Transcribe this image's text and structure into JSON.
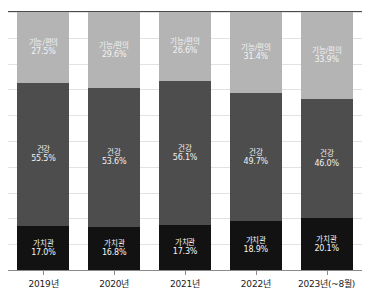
{
  "chart_data": {
    "type": "bar",
    "subtype": "stacked-100-percent",
    "title": "",
    "xlabel": "",
    "ylabel": "",
    "ylim": [
      0,
      100
    ],
    "grid": true,
    "legend_position": "none",
    "value_suffix": "%",
    "categories": [
      "2019년",
      "2020년",
      "2021년",
      "2022년",
      "2023년(~8월)"
    ],
    "series": [
      {
        "name": "가치관",
        "values": [
          17.0,
          16.8,
          17.3,
          18.9,
          20.1
        ],
        "color": "#121212"
      },
      {
        "name": "건강",
        "values": [
          55.5,
          53.6,
          56.1,
          49.7,
          46.0
        ],
        "color": "#4d4d4d"
      },
      {
        "name": "기능/편의",
        "values": [
          27.5,
          29.6,
          26.6,
          31.4,
          33.9
        ],
        "color": "#b4b4b4"
      }
    ],
    "bars": [
      {
        "category": "2019년",
        "segments": [
          {
            "name": "기능/편의",
            "value": "27.5%",
            "pct": 27.5
          },
          {
            "name": "건강",
            "value": "55.5%",
            "pct": 55.5
          },
          {
            "name": "가치관",
            "value": "17.0%",
            "pct": 17.0
          }
        ]
      },
      {
        "category": "2020년",
        "segments": [
          {
            "name": "기능/편의",
            "value": "29.6%",
            "pct": 29.6
          },
          {
            "name": "건강",
            "value": "53.6%",
            "pct": 53.6
          },
          {
            "name": "가치관",
            "value": "16.8%",
            "pct": 16.8
          }
        ]
      },
      {
        "category": "2021년",
        "segments": [
          {
            "name": "기능/편의",
            "value": "26.6%",
            "pct": 26.6
          },
          {
            "name": "건강",
            "value": "56.1%",
            "pct": 56.1
          },
          {
            "name": "가치관",
            "value": "17.3%",
            "pct": 17.3
          }
        ]
      },
      {
        "category": "2022년",
        "segments": [
          {
            "name": "기능/편의",
            "value": "31.4%",
            "pct": 31.4
          },
          {
            "name": "건강",
            "value": "49.7%",
            "pct": 49.7
          },
          {
            "name": "가치관",
            "value": "18.9%",
            "pct": 18.9
          }
        ]
      },
      {
        "category": "2023년(~8월)",
        "segments": [
          {
            "name": "기능/편의",
            "value": "33.9%",
            "pct": 33.9
          },
          {
            "name": "건강",
            "value": "46.0%",
            "pct": 46.0
          },
          {
            "name": "가치관",
            "value": "20.1%",
            "pct": 20.1
          }
        ]
      }
    ],
    "colors": {
      "segment_top": "#b4b4b4",
      "segment_middle": "#4d4d4d",
      "segment_bottom": "#121212",
      "gridline": "#e2e2e2",
      "axis": "#8a8a8a",
      "top_rule": "#4a4a4a",
      "label_light": "#f2f2f2",
      "label_dark": "#1a1a1a"
    },
    "gridline_count": 10
  }
}
